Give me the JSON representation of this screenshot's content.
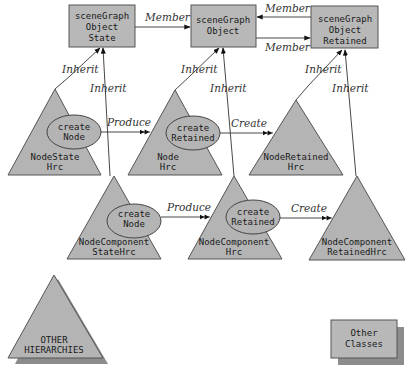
{
  "diagram": {
    "classes": [
      {
        "id": "sgo_state",
        "lines": [
          "sceneGraph",
          "Object",
          "State"
        ]
      },
      {
        "id": "sgo",
        "lines": [
          "sceneGraph",
          "Object"
        ]
      },
      {
        "id": "sgo_retained",
        "lines": [
          "sceneGraph",
          "Object",
          "Retained"
        ]
      }
    ],
    "hierarchies": [
      {
        "id": "node_state_hrc",
        "lines": [
          "NodeState",
          "Hrc"
        ],
        "method": [
          "create",
          "Node"
        ]
      },
      {
        "id": "node_hrc",
        "lines": [
          "Node",
          "Hrc"
        ],
        "method": [
          "create",
          "Retained"
        ]
      },
      {
        "id": "node_retained_hrc",
        "lines": [
          "NodeRetained",
          "Hrc"
        ]
      },
      {
        "id": "nodecomp_state_hrc",
        "lines": [
          "NodeComponent",
          "StateHrc"
        ],
        "method": [
          "create",
          "Node"
        ]
      },
      {
        "id": "nodecomp_hrc",
        "lines": [
          "NodeComponent",
          "Hrc"
        ],
        "method": [
          "create",
          "Retained"
        ]
      },
      {
        "id": "nodecomp_retained_hrc",
        "lines": [
          "NodeComponent",
          "RetainedHrc"
        ]
      }
    ],
    "edges": {
      "member_1": "Member",
      "member_2": "Member",
      "member_3": "Member",
      "inherit_1": "Inherit",
      "inherit_2": "Inherit",
      "inherit_3": "Inherit",
      "inherit_4": "Inherit",
      "inherit_5": "Inherit",
      "inherit_6": "Inherit",
      "produce_1": "Produce",
      "produce_2": "Produce",
      "create_1": "Create",
      "create_2": "Create"
    },
    "legend": {
      "other_hierarchies": [
        "OTHER",
        "HIERARCHIES"
      ],
      "other_classes": [
        "Other",
        "Classes"
      ]
    },
    "colors": {
      "shape_fill": "#b8b8b8",
      "shadow": "#8c8c8c",
      "stroke": "#555555"
    }
  }
}
